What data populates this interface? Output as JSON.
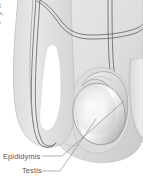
{
  "figure": {
    "kind": "anatomical-illustration",
    "style": "grayscale line-and-tone medical illustration",
    "background_color": "#ffffff",
    "tissue_fill_color": "#e2e2e2",
    "tissue_edge_color": "#c9c9c9",
    "duct_line_color": "#6b6b6b",
    "testis_highlight_color": "#fbfbfb",
    "testis_shadow_color": "#a8a8a8",
    "leader_line_color": "#8e8e90",
    "label_text_color": "#58585a",
    "bleed_text_color": "#6f6f6f"
  },
  "labels": {
    "epididymis": "Epididymis",
    "testis": "Testis"
  },
  "column_bleed_text": {
    "line_1": "ng",
    "line_2": "ure,",
    "line_3": "es",
    "line_4": "g."
  }
}
